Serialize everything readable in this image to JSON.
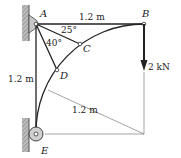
{
  "diagram": {
    "type": "truss-frame",
    "points": {
      "A": "A",
      "B": "B",
      "C": "C",
      "D": "D",
      "E": "E"
    },
    "dimensions": {
      "AB": "1.2 m",
      "AE": "1.2 m",
      "radius": "1.2 m"
    },
    "angles": {
      "BAC": "25°",
      "CAD": "40°"
    },
    "load": {
      "value": "2 kN",
      "at": "B",
      "direction": "down"
    },
    "colors": {
      "line": "#222222",
      "wall": "#8a8a8a",
      "thin": "#555555"
    }
  }
}
